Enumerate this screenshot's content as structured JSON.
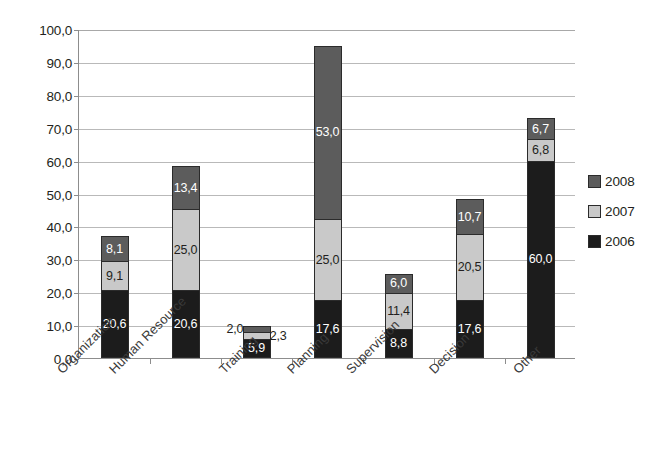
{
  "chart_data": {
    "type": "bar",
    "subtype": "stacked-bar",
    "title": "",
    "xlabel": "",
    "ylabel": "",
    "ylim": [
      0,
      100
    ],
    "ytick_step": 10,
    "ytick_labels": [
      "0,0",
      "10,0",
      "20,0",
      "30,0",
      "40,0",
      "50,0",
      "60,0",
      "70,0",
      "80,0",
      "90,0",
      "100,0"
    ],
    "decimal_separator": ",",
    "grid": true,
    "legend_position": "right",
    "categories": [
      "Organization",
      "Human Resource",
      "Training",
      "Planning",
      "Supervision",
      "Decision",
      "Other"
    ],
    "series": [
      {
        "name": "2006",
        "color": "#1c1c1c",
        "values": [
          20.6,
          20.6,
          5.9,
          17.6,
          8.8,
          17.6,
          60.0
        ],
        "labels": [
          "20,6",
          "20,6",
          "5,9",
          "17,6",
          "8,8",
          "17,6",
          "60,0"
        ]
      },
      {
        "name": "2007",
        "color": "#c9c9c9",
        "values": [
          9.1,
          25.0,
          2.3,
          25.0,
          11.4,
          20.5,
          6.8
        ],
        "labels": [
          "9,1",
          "25,0",
          "2,3",
          "25,0",
          "11,4",
          "20,5",
          "6,8"
        ]
      },
      {
        "name": "2008",
        "color": "#5c5c5c",
        "values": [
          8.1,
          13.4,
          2.0,
          53.0,
          6.0,
          10.7,
          6.7
        ],
        "labels": [
          "8,1",
          "13,4",
          "2,0",
          "53,0",
          "6,0",
          "10,7",
          "6,7"
        ]
      }
    ],
    "totals": [
      37.8,
      59.0,
      10.2,
      95.6,
      26.2,
      48.8,
      73.5
    ],
    "legend": [
      {
        "label": "2008",
        "color": "#5c5c5c"
      },
      {
        "label": "2007",
        "color": "#c9c9c9"
      },
      {
        "label": "2006",
        "color": "#1c1c1c"
      }
    ]
  }
}
